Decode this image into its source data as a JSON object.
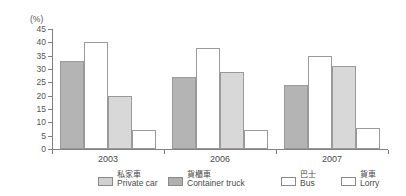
{
  "chart_data": {
    "type": "bar",
    "title": "",
    "subtitle": "",
    "xlabel": "",
    "ylabel": "(%)",
    "unit_label": "(%)",
    "categories": [
      "2003",
      "2006",
      "2007"
    ],
    "ylim": [
      0,
      45
    ],
    "yticks": [
      0,
      5,
      10,
      15,
      20,
      25,
      30,
      35,
      40,
      45
    ],
    "ytick_labels": [
      "0",
      "5",
      "10",
      "15",
      "20",
      "25",
      "30",
      "35",
      "40",
      "45"
    ],
    "grid": false,
    "legend_position": "bottom",
    "series": [
      {
        "name": "Private car",
        "name_zh": "私家車",
        "color": "#b4b4b4",
        "values": [
          33,
          27,
          24
        ]
      },
      {
        "name": "Container truck",
        "name_zh": "貨櫃車",
        "color": "#ffffff",
        "values": [
          40,
          38,
          35
        ]
      },
      {
        "name": "Bus",
        "name_zh": "巴士",
        "color": "#d8d8d8",
        "values": [
          20,
          29,
          31
        ]
      },
      {
        "name": "Lorry",
        "name_zh": "貨車",
        "color": "#ffffff",
        "values": [
          7,
          7,
          8
        ]
      }
    ]
  },
  "legend": {
    "items": [
      {
        "zh": "私家車",
        "en": "Private car"
      },
      {
        "zh": "貨櫃車",
        "en": "Container truck"
      },
      {
        "zh": "巴士",
        "en": "Bus"
      },
      {
        "zh": "貨車",
        "en": "Lorry"
      }
    ]
  }
}
